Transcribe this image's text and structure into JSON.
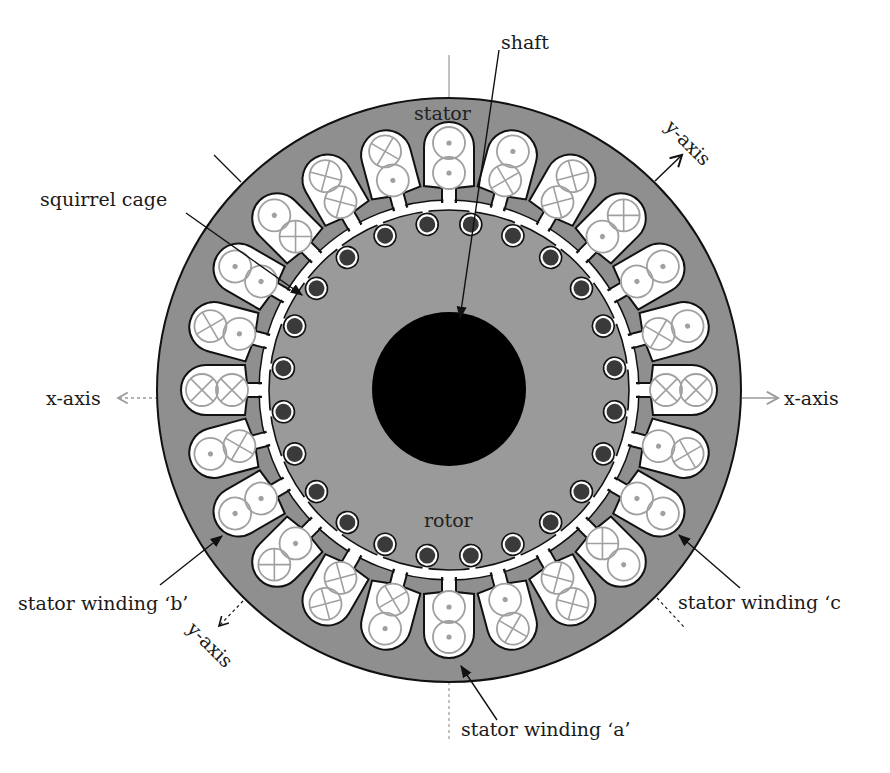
{
  "labels": {
    "shaft": "shaft",
    "stator": "stator",
    "rotor": "rotor",
    "squirrel_cage": "squirrel cage",
    "x_axis_left": "x-axis",
    "x_axis_right": "x-axis",
    "y_axis_top": "y-axis",
    "y_axis_bottom": "y-axis",
    "winding_a": "stator winding ‘a’",
    "winding_b": "stator winding ‘b’",
    "winding_c": "stator winding ‘c"
  },
  "colors": {
    "stator_fill": "#8f8f8f",
    "rotor_fill": "#9a9a9a",
    "slot_fill": "#ffffff",
    "outline": "#111111",
    "conductor_stroke": "#a0a0a0",
    "bar_fill": "#3a3a3a",
    "shaft_fill": "#000000",
    "axis_line": "#9a9a9a"
  },
  "geometry": {
    "center": [
      449,
      390
    ],
    "stator_radius": 292,
    "shaft_radius": 77,
    "slot_count": 24,
    "rotor_bar_count": 24
  },
  "conductor_legend": {
    "dot": "current out of page",
    "cross": "current into page"
  },
  "slots": [
    {
      "angle": 0,
      "outer": "dot",
      "inner": "dot"
    },
    {
      "angle": 15,
      "outer": "dot",
      "inner": "cross"
    },
    {
      "angle": 30,
      "outer": "cross",
      "inner": "cross"
    },
    {
      "angle": 45,
      "outer": "cross",
      "inner": "dot"
    },
    {
      "angle": 60,
      "outer": "dot",
      "inner": "dot"
    },
    {
      "angle": 75,
      "outer": "dot",
      "inner": "cross"
    },
    {
      "angle": 90,
      "outer": "cross",
      "inner": "cross"
    },
    {
      "angle": 105,
      "outer": "cross",
      "inner": "dot"
    },
    {
      "angle": 120,
      "outer": "dot",
      "inner": "dot"
    },
    {
      "angle": 135,
      "outer": "dot",
      "inner": "cross"
    },
    {
      "angle": 150,
      "outer": "cross",
      "inner": "cross"
    },
    {
      "angle": 165,
      "outer": "cross",
      "inner": "dot"
    },
    {
      "angle": 180,
      "outer": "dot",
      "inner": "dot"
    },
    {
      "angle": 195,
      "outer": "dot",
      "inner": "cross"
    },
    {
      "angle": 210,
      "outer": "cross",
      "inner": "cross"
    },
    {
      "angle": 225,
      "outer": "cross",
      "inner": "dot"
    },
    {
      "angle": 240,
      "outer": "dot",
      "inner": "dot"
    },
    {
      "angle": 255,
      "outer": "dot",
      "inner": "cross"
    },
    {
      "angle": 270,
      "outer": "cross",
      "inner": "cross"
    },
    {
      "angle": 285,
      "outer": "cross",
      "inner": "dot"
    },
    {
      "angle": 300,
      "outer": "dot",
      "inner": "dot"
    },
    {
      "angle": 315,
      "outer": "dot",
      "inner": "cross"
    },
    {
      "angle": 330,
      "outer": "cross",
      "inner": "cross"
    },
    {
      "angle": 345,
      "outer": "cross",
      "inner": "dot"
    }
  ]
}
